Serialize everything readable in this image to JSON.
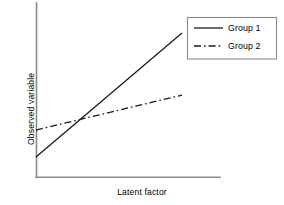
{
  "chart_data": {
    "type": "line",
    "title": "",
    "xlabel": "Latent factor",
    "ylabel": "Observed variable",
    "grid": false,
    "legend_position": "top-right",
    "xlim": [
      0,
      1
    ],
    "ylim": [
      0,
      1
    ],
    "axis_ticks": {
      "x": [],
      "y": []
    },
    "annotations": [],
    "series": [
      {
        "name": "Group 1",
        "style": "solid",
        "color": "#1a1a1a",
        "x": [
          0.0,
          1.0
        ],
        "y": [
          0.115,
          0.828
        ],
        "note": "Steeper slope; starts lower and ends highest"
      },
      {
        "name": "Group 2",
        "style": "dash-dot",
        "color": "#1a1a1a",
        "x": [
          0.0,
          1.0
        ],
        "y": [
          0.27,
          0.471
        ],
        "note": "Shallower slope; starts higher, crosses Group 1"
      }
    ],
    "intersection": {
      "x": 0.247,
      "y": 0.305
    }
  },
  "figure": {
    "background_color": "#ffffff",
    "axis_color": "#8a8a8a",
    "line_color": "#1a1a1a",
    "legend_border_color": "#8a8a8a"
  },
  "legend": {
    "entries": [
      {
        "label": "Group 1",
        "style": "solid"
      },
      {
        "label": "Group 2",
        "style": "dash-dot"
      }
    ]
  }
}
